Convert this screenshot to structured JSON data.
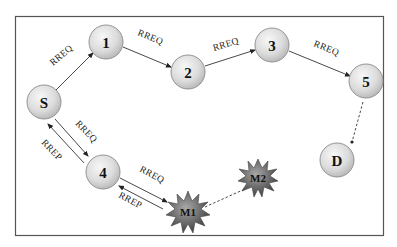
{
  "diagram": {
    "frame": {
      "x": 15,
      "y": 16,
      "w": 369,
      "h": 220,
      "stroke": "#555555"
    },
    "colors": {
      "node_fill_light": "#f2f2f2",
      "node_fill_dark": "#b8b8b8",
      "node_stroke": "#8a8a8a",
      "malicious_fill_light": "#9a9a9a",
      "malicious_fill_dark": "#3e3e3e",
      "edge": "#333333"
    },
    "nodes": [
      {
        "id": "S",
        "label": "S",
        "x": 44,
        "y": 102,
        "type": "normal"
      },
      {
        "id": "1",
        "label": "1",
        "x": 106,
        "y": 42,
        "type": "normal"
      },
      {
        "id": "2",
        "label": "2",
        "x": 188,
        "y": 72,
        "type": "normal"
      },
      {
        "id": "3",
        "label": "3",
        "x": 272,
        "y": 45,
        "type": "normal"
      },
      {
        "id": "5",
        "label": "5",
        "x": 366,
        "y": 81,
        "type": "normal"
      },
      {
        "id": "D",
        "label": "D",
        "x": 337,
        "y": 160,
        "type": "normal"
      },
      {
        "id": "4",
        "label": "4",
        "x": 103,
        "y": 172,
        "type": "normal"
      },
      {
        "id": "M1",
        "label": "M1",
        "x": 188,
        "y": 212,
        "type": "malicious"
      },
      {
        "id": "M2",
        "label": "M2",
        "x": 258,
        "y": 178,
        "type": "malicious"
      }
    ],
    "edges": [
      {
        "from": "S",
        "to": "1",
        "label": "RREQ",
        "style": "solid"
      },
      {
        "from": "1",
        "to": "2",
        "label": "RREQ",
        "style": "solid"
      },
      {
        "from": "2",
        "to": "3",
        "label": "RREQ",
        "style": "solid"
      },
      {
        "from": "3",
        "to": "5",
        "label": "RREQ",
        "style": "solid"
      },
      {
        "from": "5",
        "to": "D",
        "label": "",
        "style": "dashed"
      },
      {
        "from": "S",
        "to": "4",
        "label": "RREQ",
        "style": "solid"
      },
      {
        "from": "4",
        "to": "S",
        "label": "RREP",
        "style": "solid"
      },
      {
        "from": "4",
        "to": "M1",
        "label": "RREQ",
        "style": "solid"
      },
      {
        "from": "M1",
        "to": "4",
        "label": "RREP",
        "style": "solid"
      },
      {
        "from": "M1",
        "to": "M2",
        "label": "",
        "style": "dashed"
      }
    ],
    "edge_labels": {
      "s_1": "RREQ",
      "n1_2": "RREQ",
      "n2_3": "RREQ",
      "n3_5": "RREQ",
      "s_4_req": "RREQ",
      "s_4_rep": "RREP",
      "n4_m1_req": "RREQ",
      "n4_m1_rep": "RREP"
    },
    "node_labels": {
      "S": "S",
      "n1": "1",
      "n2": "2",
      "n3": "3",
      "n5": "5",
      "D": "D",
      "n4": "4",
      "M1": "M1",
      "M2": "M2"
    }
  }
}
